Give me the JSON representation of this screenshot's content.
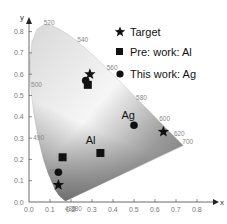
{
  "chart_data": {
    "type": "scatter",
    "title": "",
    "xlabel": "x",
    "ylabel": "y",
    "xlim": [
      0.0,
      0.85
    ],
    "ylim": [
      0.0,
      0.85
    ],
    "grid": false,
    "legend_position": "upper right",
    "x_ticks": [
      "0.0",
      "0.1",
      "0.2",
      "0.3",
      "0.4",
      "0.5",
      "0.6",
      "0.7",
      "0.8"
    ],
    "y_ticks": [
      "0.0",
      "0.1",
      "0.2",
      "0.3",
      "0.4",
      "0.5",
      "0.6",
      "0.7",
      "0.8"
    ],
    "background": "CIE 1931 chromaticity diagram (grayscale)",
    "wavelength_labels": [
      {
        "label": "520",
        "x": 0.07,
        "y": 0.83
      },
      {
        "label": "540",
        "x": 0.23,
        "y": 0.75
      },
      {
        "label": "560",
        "x": 0.37,
        "y": 0.62
      },
      {
        "label": "580",
        "x": 0.51,
        "y": 0.48
      },
      {
        "label": "600",
        "x": 0.62,
        "y": 0.38
      },
      {
        "label": "620",
        "x": 0.69,
        "y": 0.31
      },
      {
        "label": "700",
        "x": 0.73,
        "y": 0.27
      },
      {
        "label": "500",
        "x": 0.01,
        "y": 0.54
      },
      {
        "label": "490",
        "x": 0.02,
        "y": 0.29
      },
      {
        "label": "480",
        "x": 0.09,
        "y": 0.13
      },
      {
        "label": "470",
        "x": 0.12,
        "y": 0.05
      },
      {
        "label": "430",
        "x": 0.17,
        "y": -0.04
      },
      {
        "label": "380",
        "x": 0.2,
        "y": -0.04
      }
    ],
    "series": [
      {
        "name": "Target",
        "marker": "star",
        "points": [
          {
            "x": 0.14,
            "y": 0.08
          },
          {
            "x": 0.29,
            "y": 0.6
          },
          {
            "x": 0.64,
            "y": 0.33
          }
        ]
      },
      {
        "name": "Pre: work: Al",
        "marker": "square",
        "points": [
          {
            "x": 0.16,
            "y": 0.21
          },
          {
            "x": 0.34,
            "y": 0.23
          },
          {
            "x": 0.28,
            "y": 0.55
          }
        ]
      },
      {
        "name": "This work: Ag",
        "marker": "circle",
        "points": [
          {
            "x": 0.14,
            "y": 0.14
          },
          {
            "x": 0.27,
            "y": 0.57
          },
          {
            "x": 0.5,
            "y": 0.36
          }
        ]
      }
    ],
    "annotations": [
      {
        "text": "Al",
        "x": 0.27,
        "y": 0.27
      },
      {
        "text": "Ag",
        "x": 0.44,
        "y": 0.39
      }
    ]
  },
  "legend": {
    "items": [
      {
        "label": "Target"
      },
      {
        "label": "Pre: work: Al"
      },
      {
        "label": "This work: Ag"
      }
    ]
  },
  "axes": {
    "x_name": "x",
    "y_name": "y"
  }
}
